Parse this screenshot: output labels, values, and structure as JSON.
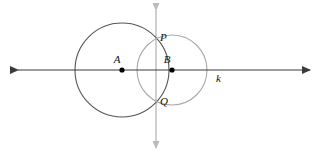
{
  "figure": {
    "type": "geometry-diagram",
    "background_color": "#ffffff"
  },
  "colors": {
    "circle_a_stroke": "#555555",
    "circle_b_stroke": "#aaaaaa",
    "line_k_stroke": "#3a3a3a",
    "line_pq_stroke": "#bbbbbb",
    "point_fill": "#000000",
    "label_fill": "#111111"
  },
  "circles": [
    {
      "name": "circle-a",
      "center_label": "A",
      "cx": 122,
      "cy": 70,
      "r": 47,
      "stroke": "#555555",
      "stroke_width": 1.1
    },
    {
      "name": "circle-b",
      "center_label": "B",
      "cx": 172,
      "cy": 70,
      "r": 35,
      "stroke": "#aaaaaa",
      "stroke_width": 1.1
    }
  ],
  "points": [
    {
      "id": "A",
      "label": "A",
      "x": 122,
      "y": 70,
      "dot": true,
      "label_x": 117,
      "label_y": 63
    },
    {
      "id": "B",
      "label": "B",
      "x": 172,
      "y": 70,
      "dot": true,
      "label_x": 167,
      "label_y": 63
    },
    {
      "id": "P",
      "label": "P",
      "x": 156,
      "y": 40,
      "dot": false,
      "label_x": 160,
      "label_y": 41
    },
    {
      "id": "Q",
      "label": "Q",
      "x": 156,
      "y": 99,
      "dot": false,
      "label_x": 160,
      "label_y": 105
    }
  ],
  "lines": [
    {
      "id": "k",
      "label": "k",
      "orientation": "horizontal",
      "x1": 18,
      "y1": 70,
      "x2": 310,
      "y2": 70,
      "arrows": "both",
      "label_x": 216,
      "label_y": 82
    },
    {
      "id": "PQ",
      "label": "",
      "orientation": "vertical",
      "x1": 156,
      "y1": 10,
      "x2": 156,
      "y2": 148,
      "arrows": "both",
      "label_x": 0,
      "label_y": 0
    }
  ],
  "labels": {
    "A": "A",
    "B": "B",
    "P": "P",
    "Q": "Q",
    "k": "k"
  }
}
